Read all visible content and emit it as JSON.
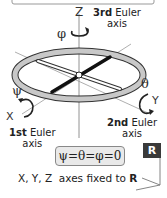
{
  "diagram": {
    "axes": {
      "z": {
        "letter": "Z",
        "rotation_symbol": "φ",
        "ordinal": "3rd",
        "label_word": "Euler",
        "label_line2": "axis"
      },
      "y": {
        "letter": "Y",
        "rotation_symbol": "θ",
        "ordinal": "2nd",
        "label_word": "Euler",
        "label_line2": "axis"
      },
      "x": {
        "letter": "X",
        "rotation_symbol": "ψ",
        "ordinal": "1st",
        "label_word": "Euler",
        "label_line2": "axis"
      }
    },
    "equation": "ψ=θ=φ=0",
    "reference_badge": "R",
    "caption": {
      "prefix": "X, Y, Z  axes fixed to ",
      "frame": "R"
    },
    "colors": {
      "ring_fill": "#c8c8c8",
      "ring_stroke": "#333333",
      "bar_dark": "#111111",
      "bar_light": "#ffffff",
      "badge_bg": "#3a3a3a",
      "equation_bg": "#e9e9e9"
    }
  }
}
